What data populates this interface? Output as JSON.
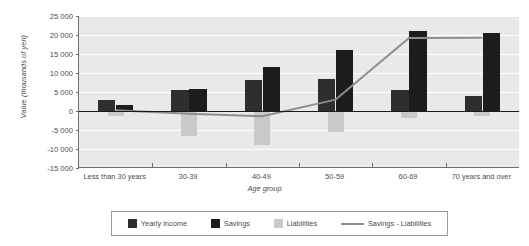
{
  "chart_data": {
    "type": "bar",
    "title": "",
    "xlabel": "Age group",
    "ylabel": "Value (thousands of yen)",
    "ylim": [
      -15000,
      25000
    ],
    "ytick_step": 5000,
    "ytick_labels": [
      "25 000",
      "20 000",
      "15 000",
      "10 000",
      "5 000",
      "0",
      "-5 000",
      "-10 000",
      "-15 000"
    ],
    "ytick_values": [
      25000,
      20000,
      15000,
      10000,
      5000,
      0,
      -5000,
      -10000,
      -15000
    ],
    "grid": true,
    "legend_position": "bottom",
    "categories": [
      "Less than 30 years",
      "30-39",
      "40-49",
      "50-59",
      "60-69",
      "70 years and over"
    ],
    "series": [
      {
        "name": "Yearly income",
        "type": "bar",
        "color": "#2e2e2e",
        "values": [
          3000,
          5400,
          8100,
          8500,
          5500,
          4000
        ]
      },
      {
        "name": "Savings",
        "type": "bar",
        "color": "#1c1c1c",
        "values": [
          1500,
          5900,
          11500,
          16000,
          21000,
          20500
        ]
      },
      {
        "name": "Liabilities",
        "type": "bar",
        "color": "#c9c9c9",
        "values": [
          -1300,
          -6600,
          -9000,
          -5500,
          -1800,
          -1200
        ]
      },
      {
        "name": "Savings - Liabilities",
        "type": "line",
        "color": "#8d8d8d",
        "values": [
          200,
          -700,
          -1400,
          3000,
          19200,
          19300
        ]
      }
    ]
  },
  "legend": {
    "items": [
      {
        "label": "Yearly income",
        "marker": "swatch-dark-icon"
      },
      {
        "label": "Savings",
        "marker": "swatch-darker-icon"
      },
      {
        "label": "Liabilities",
        "marker": "swatch-light-icon"
      },
      {
        "label": "Savings - Liabilities",
        "marker": "line-marker-icon"
      }
    ]
  }
}
